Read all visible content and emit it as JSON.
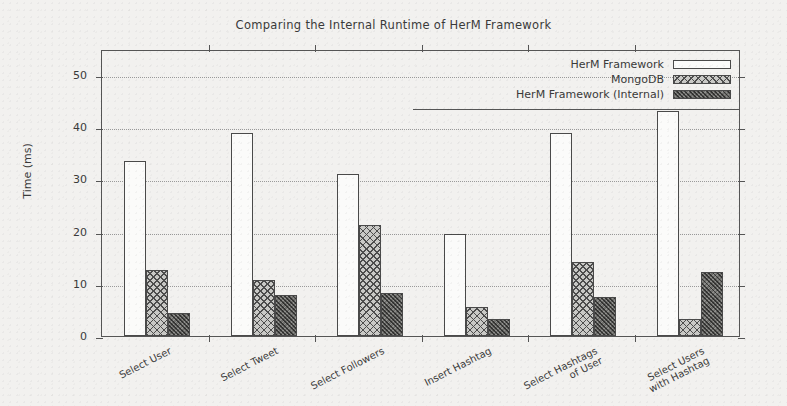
{
  "chart_data": {
    "type": "bar",
    "title": "Comparing the Internal Runtime of HerM Framework",
    "xlabel": "",
    "ylabel": "Time (ms)",
    "ylim": [
      0,
      55
    ],
    "yticks": [
      0,
      10,
      20,
      30,
      40,
      50
    ],
    "ytick_labels": [
      "0",
      "10",
      "20",
      "30",
      "40",
      "50"
    ],
    "grid": "horizontal-dotted",
    "legend_position": "top-right",
    "categories": [
      "Select User",
      "Select Tweet",
      "Select Followers",
      "Insert Hashtag",
      "Select Hashtags\nof User",
      "Select Users\nwith Hashtag"
    ],
    "series": [
      {
        "name": "HerM Framework",
        "pattern": "empty",
        "color": "#fbfbfa",
        "values": [
          33.6,
          38.9,
          31.0,
          19.5,
          38.9,
          43.1
        ]
      },
      {
        "name": "MongoDB",
        "pattern": "crosshatch",
        "color": "#c9c9c6",
        "values": [
          12.6,
          10.7,
          21.3,
          5.6,
          14.2,
          3.3
        ]
      },
      {
        "name": "HerM Framework (Internal)",
        "pattern": "dense-dark",
        "color": "#6f6f6c",
        "values": [
          4.5,
          7.8,
          8.3,
          3.2,
          7.4,
          12.2
        ]
      }
    ]
  },
  "figure": {
    "background_color": "#f2f1ef",
    "axis_color": "#555555",
    "gridline_color": "#9a9a9a",
    "text_color": "#3a3a3a"
  }
}
